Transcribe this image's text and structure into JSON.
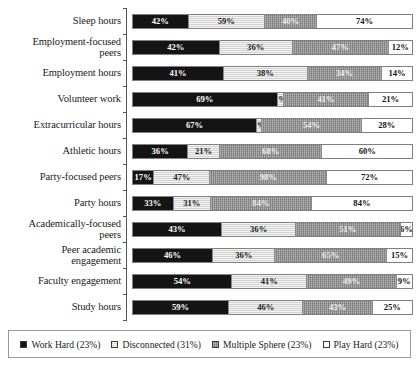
{
  "chart_data": {
    "type": "bar",
    "orientation": "horizontal",
    "stacked": true,
    "normalized": true,
    "title": "",
    "subtitle": "",
    "xlabel": "",
    "ylabel": "",
    "grid": false,
    "legend_position": "bottom",
    "axis_visible": "y-left",
    "value_suffix": "%",
    "categories": [
      "Sleep hours",
      "Employment-focused\npeers",
      "Employment hours",
      "Volunteer work",
      "Extracurricular hours",
      "Athletic hours",
      "Party-focused peers",
      "Party hours",
      "Academically-focused\npeers",
      "Peer academic\nengagement",
      "Faculty engagement",
      "Study hours"
    ],
    "series": [
      {
        "name": "Work Hard (23%)",
        "share": "23%",
        "color": "#141414",
        "values": [
          42,
          42,
          41,
          69,
          67,
          36,
          17,
          33,
          43,
          46,
          54,
          59
        ],
        "labels": [
          "42%",
          "42%",
          "41%",
          "69%",
          "67%",
          "36%",
          "17%",
          "33%",
          "43%",
          "46%",
          "54%",
          "59%"
        ]
      },
      {
        "name": "Disconnected (31%)",
        "share": "31%",
        "color": "#d2d2d2",
        "values": [
          59,
          36,
          38,
          3,
          3,
          21,
          47,
          31,
          36,
          36,
          41,
          46
        ],
        "labels": [
          "59%",
          "36%",
          "38%",
          "3%",
          "3%",
          "21%",
          "47%",
          "31%",
          "36%",
          "36%",
          "41%",
          "46%"
        ]
      },
      {
        "name": "Multiple Sphere (23%)",
        "share": "23%",
        "color": "#8e8e8e",
        "values": [
          40,
          47,
          34,
          41,
          54,
          68,
          98,
          84,
          51,
          65,
          49,
          43
        ],
        "labels": [
          "40%",
          "47%",
          "34%",
          "41%",
          "54%",
          "68%",
          "98%",
          "84%",
          "51%",
          "65%",
          "49%",
          "43%"
        ]
      },
      {
        "name": "Play Hard (23%)",
        "share": "23%",
        "color": "#ffffff",
        "values": [
          74,
          12,
          14,
          21,
          28,
          60,
          72,
          84,
          6,
          15,
          9,
          25
        ],
        "labels": [
          "74%",
          "12%",
          "14%",
          "21%",
          "28%",
          "60%",
          "72%",
          "84%",
          "6%",
          "15%",
          "9%",
          "25%"
        ]
      }
    ]
  },
  "legend": {
    "items": [
      {
        "label": "Work Hard (23%)"
      },
      {
        "label": "Disconnected (31%)"
      },
      {
        "label": "Multiple Sphere (23%)"
      },
      {
        "label": "Play Hard (23%)"
      }
    ]
  }
}
